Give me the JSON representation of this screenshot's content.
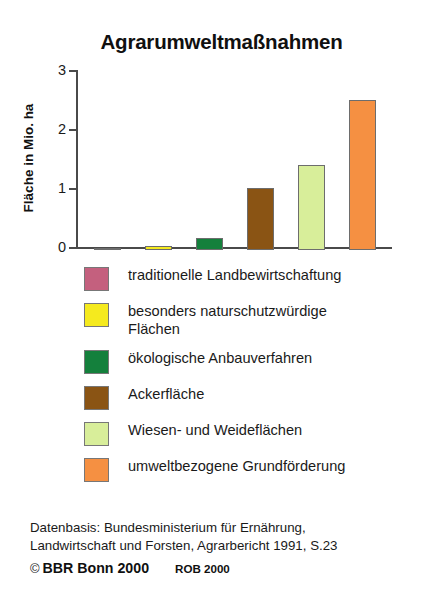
{
  "chart_data": {
    "type": "bar",
    "title": "Agrarumweltmaßnahmen",
    "xlabel": "",
    "ylabel": "Fläche in Mio. ha",
    "ylim": [
      0,
      3
    ],
    "yticks": [
      "0",
      "1",
      "2",
      "3"
    ],
    "ytick_values": [
      0,
      1,
      2,
      3
    ],
    "grid": false,
    "legend_position": "below",
    "categories": [
      "traditionelle Landbewirtschaftung",
      "besonders naturschutzwürdige Flächen",
      "ökologische Anbauverfahren",
      "Ackerfläche",
      "Wiesen- und Weideflächen",
      "umweltbezogene Grundförderung"
    ],
    "values": [
      0.02,
      0.07,
      0.21,
      1.05,
      1.45,
      2.55
    ],
    "colors": [
      "#c4607e",
      "#f5ea1e",
      "#14803c",
      "#8a5414",
      "#d8ee9a",
      "#f59042"
    ]
  },
  "chart": {
    "title": "Agrarumweltmaßnahmen",
    "y_axis_title": "Fläche in Mio. ha",
    "ticks": [
      {
        "label": "3",
        "value": 3
      },
      {
        "label": "2",
        "value": 2
      },
      {
        "label": "1",
        "value": 1
      },
      {
        "label": "0",
        "value": 0
      }
    ],
    "bars": [
      {
        "name": "traditionelle-landbewirtschaftung",
        "value": 0.02,
        "color": "#c4607e"
      },
      {
        "name": "besonders-naturschutzwuerdige-flaechen",
        "value": 0.07,
        "color": "#f5ea1e"
      },
      {
        "name": "oekologische-anbauverfahren",
        "value": 0.21,
        "color": "#14803c"
      },
      {
        "name": "ackerflaeche",
        "value": 1.05,
        "color": "#8a5414"
      },
      {
        "name": "wiesen-und-weideflaechen",
        "value": 1.45,
        "color": "#d8ee9a"
      },
      {
        "name": "umweltbezogene-grundfoerderung",
        "value": 2.55,
        "color": "#f59042"
      }
    ]
  },
  "legend": {
    "items": [
      {
        "label": "traditionelle Landbewirtschaftung",
        "color": "#c4607e"
      },
      {
        "label": "besonders naturschutzwürdige\nFlächen",
        "color": "#f5ea1e"
      },
      {
        "label": "ökologische Anbauverfahren",
        "color": "#14803c"
      },
      {
        "label": "Ackerfläche",
        "color": "#8a5414"
      },
      {
        "label": "Wiesen- und Weideflächen",
        "color": "#d8ee9a"
      },
      {
        "label": "umweltbezogene Grundförderung",
        "color": "#f59042"
      }
    ]
  },
  "footer": {
    "source": "Datenbasis: Bundesministerium für Ernährung,\nLandwirtschaft und Forsten, Agrarbericht 1991, S.23",
    "copyright_symbol": "©",
    "copyright": "BBR Bonn 2000",
    "rob": "ROB 2000"
  }
}
